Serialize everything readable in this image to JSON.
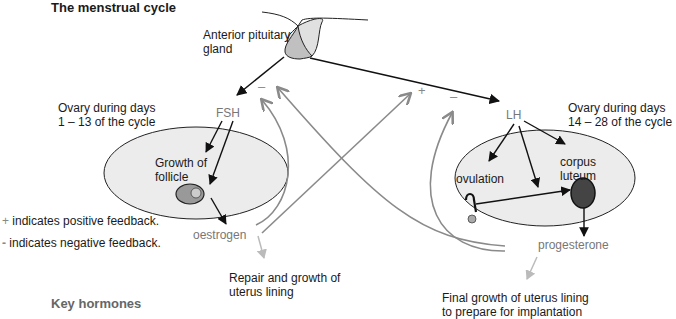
{
  "title": "The menstrual cycle",
  "key_heading": "Key hormones",
  "labels": {
    "pituitary_line1": "Anterior pituitary",
    "pituitary_line2": "gland",
    "ovary1_line1": "Ovary during days",
    "ovary1_line2": "1 – 13 of the cycle",
    "ovary2_line1": "Ovary during days",
    "ovary2_line2": "14 – 28 of the cycle",
    "growth_line1": "Growth of",
    "growth_line2": "follicle",
    "ovulation": "ovulation",
    "corpus_line1": "corpus",
    "corpus_line2": "luteum",
    "repair_line1": "Repair and growth of",
    "repair_line2": "uterus lining",
    "final_line1": "Final growth of uterus lining",
    "final_line2": "to prepare for implantation"
  },
  "hormones": {
    "fsh": "FSH",
    "lh": "LH",
    "oestrogen": "oestrogen",
    "progesterone": "progesterone"
  },
  "feedback_signs": {
    "fsh_minus": "–",
    "lh_plus": "+",
    "lh_minus": "–"
  },
  "legend": {
    "positive_symbol": "+",
    "positive_text": " indicates positive feedback.",
    "negative_symbol": "-",
    "negative_text": " indicates negative feedback."
  },
  "colors": {
    "ovary_fill": "#ececec",
    "pituitary_fill": "#c8c8c8",
    "follicle_fill": "#999999",
    "corpus_fill": "#444444",
    "feedback_arrow": "#8a8a8a",
    "effect_arrow": "#bbbbbb"
  }
}
